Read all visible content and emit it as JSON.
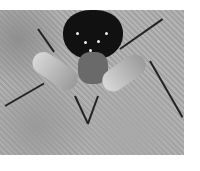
{
  "image": {
    "description": "Grayscale close-up photograph of a spiny insect (assassin bug) on a textured sandy surface",
    "palette": {
      "background": "#ffffff",
      "surface": "#ababab",
      "body": "#111111",
      "highlight": "#eeeeee"
    }
  }
}
